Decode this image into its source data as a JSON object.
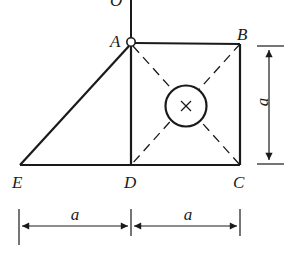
{
  "diagram": {
    "points": {
      "O": {
        "label": "O",
        "x": 131,
        "y": 0
      },
      "A": {
        "label": "A",
        "x": 131,
        "y": 42
      },
      "B": {
        "label": "B",
        "x": 240,
        "y": 44
      },
      "C": {
        "label": "C",
        "x": 240,
        "y": 165
      },
      "D": {
        "label": "D",
        "x": 131,
        "y": 165
      },
      "E": {
        "label": "E",
        "x": 20,
        "y": 165
      }
    },
    "dimensions": {
      "vertical": {
        "label": "a"
      },
      "bottom_left": {
        "label": "a"
      },
      "bottom_right": {
        "label": "a"
      }
    },
    "colors": {
      "stroke": "#1a1a1a",
      "background": "#ffffff"
    }
  }
}
